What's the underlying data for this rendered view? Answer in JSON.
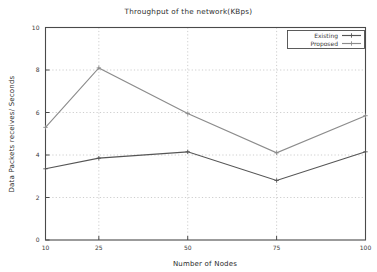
{
  "chart_data": {
    "type": "line",
    "title": "Throughput of the network(KBps)",
    "xlabel": "Number of Nodes",
    "ylabel": "Data Packets receives/ Seconds",
    "x": [
      10,
      25,
      50,
      75,
      100
    ],
    "xtick_labels": [
      "10",
      "25",
      "50",
      "75",
      "100"
    ],
    "ytick_labels": [
      "0",
      "2",
      "4",
      "6",
      "8",
      "10"
    ],
    "yticks": [
      0,
      2,
      4,
      6,
      8,
      10
    ],
    "xlim": [
      10,
      100
    ],
    "ylim": [
      0,
      10
    ],
    "grid": "y-gridlines and x-gridlines, dotted gray",
    "legend_position": "top-right inside plot",
    "series": [
      {
        "name": "Existing",
        "color": "#555555",
        "marker": "plus",
        "values": [
          3.35,
          3.85,
          4.15,
          2.8,
          4.15
        ]
      },
      {
        "name": "Proposed",
        "color": "#8c8c8c",
        "marker": "plus",
        "values": [
          5.3,
          8.1,
          5.95,
          4.1,
          5.85
        ]
      }
    ]
  },
  "legend": {
    "entries": [
      {
        "label": "Existing"
      },
      {
        "label": "Proposed"
      }
    ]
  },
  "axes": {
    "x_title": "Number of Nodes",
    "y_title": "Data Packets receives/ Seconds",
    "x_ticks": [
      "10",
      "25",
      "50",
      "75",
      "100"
    ],
    "y_ticks": [
      "0",
      "2",
      "4",
      "6",
      "8",
      "10"
    ]
  },
  "colors": {
    "existing": "#555555",
    "proposed": "#8c8c8c",
    "frame": "#4a4a4a",
    "grid": "#b9b9b9",
    "background": "#ffffff"
  }
}
